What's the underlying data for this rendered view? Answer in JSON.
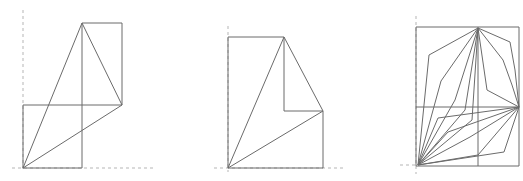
{
  "figures": [
    {
      "name": "figure-1",
      "axes": {
        "vertical": [
          [
            23,
            10
          ],
          [
            23,
            172
          ]
        ],
        "horizontal": [
          [
            12,
            168
          ],
          [
            155,
            168
          ]
        ]
      },
      "lines": [
        [
          [
            23,
            168
          ],
          [
            82,
            168
          ]
        ],
        [
          [
            23,
            168
          ],
          [
            23,
            105
          ]
        ],
        [
          [
            23,
            105
          ],
          [
            122,
            105
          ]
        ],
        [
          [
            82,
            168
          ],
          [
            82,
            23
          ]
        ],
        [
          [
            82,
            23
          ],
          [
            122,
            23
          ]
        ],
        [
          [
            122,
            23
          ],
          [
            122,
            105
          ]
        ],
        [
          [
            23,
            168
          ],
          [
            82,
            23
          ]
        ],
        [
          [
            82,
            23
          ],
          [
            122,
            105
          ]
        ],
        [
          [
            122,
            105
          ],
          [
            23,
            168
          ]
        ]
      ]
    },
    {
      "name": "figure-2",
      "axes": {
        "vertical": [
          [
            228,
            26
          ],
          [
            228,
            172
          ]
        ],
        "horizontal": [
          [
            214,
            168
          ],
          [
            346,
            168
          ]
        ]
      },
      "lines": [
        [
          [
            228,
            168
          ],
          [
            323,
            168
          ]
        ],
        [
          [
            228,
            168
          ],
          [
            228,
            37
          ]
        ],
        [
          [
            228,
            37
          ],
          [
            284,
            37
          ]
        ],
        [
          [
            284,
            37
          ],
          [
            284,
            111
          ]
        ],
        [
          [
            284,
            111
          ],
          [
            323,
            111
          ]
        ],
        [
          [
            323,
            111
          ],
          [
            323,
            168
          ]
        ],
        [
          [
            228,
            168
          ],
          [
            284,
            37
          ]
        ],
        [
          [
            284,
            37
          ],
          [
            323,
            111
          ]
        ],
        [
          [
            323,
            111
          ],
          [
            228,
            168
          ]
        ]
      ]
    },
    {
      "name": "figure-3",
      "axes": {
        "vertical": [
          [
            416,
            16
          ],
          [
            416,
            174
          ]
        ],
        "horizontal": [
          [
            400,
            165
          ],
          [
            418,
            165
          ]
        ]
      },
      "lines": [
        [
          [
            416,
            27
          ],
          [
            519,
            27
          ]
        ],
        [
          [
            416,
            27
          ],
          [
            416,
            166
          ]
        ],
        [
          [
            519,
            27
          ],
          [
            519,
            166
          ]
        ],
        [
          [
            416,
            166
          ],
          [
            519,
            166
          ]
        ],
        [
          [
            416,
            107
          ],
          [
            519,
            107
          ]
        ],
        [
          [
            478,
            27
          ],
          [
            478,
            166
          ]
        ],
        [
          [
            418,
            165
          ],
          [
            429,
            55
          ],
          [
            478,
            28
          ]
        ],
        [
          [
            418,
            165
          ],
          [
            441,
            81
          ],
          [
            478,
            28
          ]
        ],
        [
          [
            418,
            165
          ],
          [
            455,
            100
          ],
          [
            478,
            28
          ]
        ],
        [
          [
            418,
            165
          ],
          [
            465,
            110
          ],
          [
            478,
            28
          ]
        ],
        [
          [
            418,
            165
          ],
          [
            472,
            120
          ],
          [
            478,
            28
          ]
        ],
        [
          [
            478,
            28
          ],
          [
            510,
            42
          ],
          [
            515,
            70
          ],
          [
            519,
            107
          ]
        ],
        [
          [
            478,
            28
          ],
          [
            503,
            60
          ],
          [
            512,
            85
          ],
          [
            519,
            107
          ]
        ],
        [
          [
            478,
            28
          ],
          [
            487,
            90
          ],
          [
            519,
            107
          ]
        ],
        [
          [
            418,
            165
          ],
          [
            438,
            118
          ],
          [
            519,
            107
          ]
        ],
        [
          [
            418,
            165
          ],
          [
            448,
            132
          ],
          [
            519,
            107
          ]
        ],
        [
          [
            418,
            165
          ],
          [
            470,
            137
          ],
          [
            519,
            107
          ]
        ],
        [
          [
            418,
            165
          ],
          [
            504,
            152
          ],
          [
            519,
            107
          ]
        ],
        [
          [
            418,
            165
          ],
          [
            478,
            155
          ],
          [
            519,
            107
          ]
        ]
      ]
    }
  ]
}
